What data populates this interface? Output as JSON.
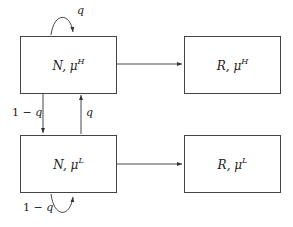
{
  "diagram": {
    "nodes": [
      {
        "id": "N_H",
        "base": "N, μ",
        "sup": "H"
      },
      {
        "id": "R_H",
        "base": "R, μ",
        "sup": "H"
      },
      {
        "id": "N_L",
        "base": "N, μ",
        "sup": "L"
      },
      {
        "id": "R_L",
        "base": "R, μ",
        "sup": "L"
      }
    ],
    "edges": [
      {
        "from": "N_H",
        "to": "N_H",
        "label_pre": "",
        "label_var": "q",
        "type": "self-loop"
      },
      {
        "from": "N_H",
        "to": "R_H",
        "label_pre": "",
        "label_var": "",
        "type": "arrow"
      },
      {
        "from": "N_H",
        "to": "N_L",
        "label_pre": "1 − ",
        "label_var": "q",
        "type": "arrow"
      },
      {
        "from": "N_L",
        "to": "N_H",
        "label_pre": "",
        "label_var": "q",
        "type": "arrow"
      },
      {
        "from": "N_L",
        "to": "R_L",
        "label_pre": "",
        "label_var": "",
        "type": "arrow"
      },
      {
        "from": "N_L",
        "to": "N_L",
        "label_pre": "1 − ",
        "label_var": "q",
        "type": "self-loop"
      }
    ],
    "colors": {
      "stroke": "#444444",
      "background": "#ffffff"
    }
  }
}
